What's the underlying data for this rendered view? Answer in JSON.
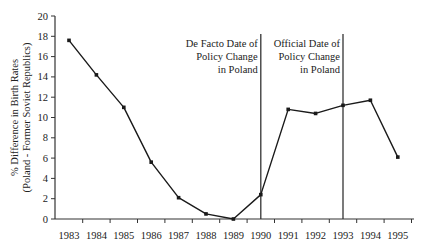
{
  "chart_data": {
    "type": "line",
    "title": "",
    "xlabel": "",
    "ylabel": "% Difference in Birth Rates (Poland - Former Soviet Republics)",
    "ylabel_lines": [
      "% Difference in Birth Rates",
      "(Poland - Former Soviet Republics)"
    ],
    "categories": [
      "1983",
      "1984",
      "1985",
      "1986",
      "1987",
      "1988",
      "1989",
      "1990",
      "1991",
      "1992",
      "1993",
      "1994",
      "1995"
    ],
    "series": [
      {
        "name": "Poland - Former Soviet Republics",
        "values": [
          17.6,
          14.2,
          11.0,
          5.6,
          2.1,
          0.5,
          0.0,
          2.4,
          10.8,
          10.4,
          11.2,
          11.7,
          6.1
        ]
      }
    ],
    "ylim": [
      0,
      20
    ],
    "yticks": [
      0,
      2,
      4,
      6,
      8,
      10,
      12,
      14,
      16,
      18,
      20
    ],
    "grid": false,
    "legend": "none",
    "annotations": [
      {
        "x": "1990",
        "lines": [
          "De Facto Date of",
          "Policy Change",
          "in Poland"
        ]
      },
      {
        "x": "1993",
        "lines": [
          "Official Date  of",
          "Policy Change",
          "in Poland"
        ]
      }
    ],
    "colors": {
      "line": "#1a1a1a",
      "axis": "#333333",
      "vline": "#333333"
    }
  }
}
